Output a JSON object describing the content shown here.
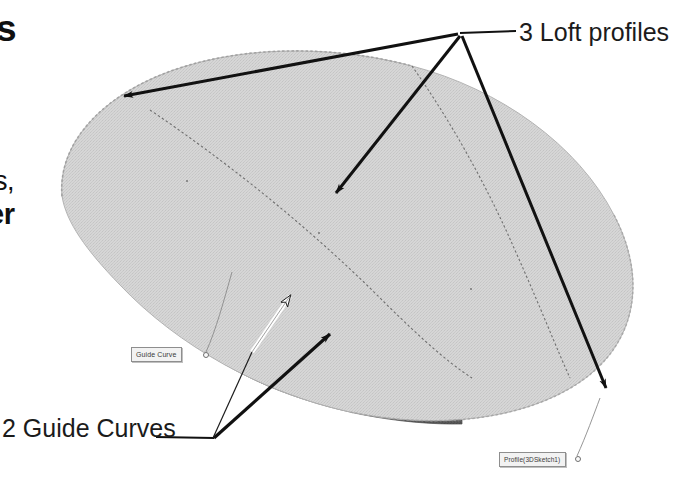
{
  "figure": {
    "type": "cad-loft-diagram",
    "colors": {
      "top_surface": "#d2d2d2",
      "side_face": "#565656",
      "leader_line": "#111111",
      "white_arrow_fill": "#ffffff",
      "page_background": "#ffffff",
      "cad_box_fill": "#f2f2f2",
      "cad_box_border": "#8e8e8e",
      "dotted_curve": "#6e6e6e"
    }
  },
  "annotations": {
    "loft_profiles_label": "3 Loft profiles",
    "guide_curves_label": "2 Guide Curves"
  },
  "cad_callouts": [
    {
      "name": "guide-curve",
      "text": "Guide Curve"
    },
    {
      "name": "profile-3dsketch1",
      "text": "Profile(3DSketch1)"
    }
  ],
  "clipped_text_fragments": [
    {
      "name": "fragment-top",
      "text": "s"
    },
    {
      "name": "fragment-middle",
      "text": "s,"
    },
    {
      "name": "fragment-bottom",
      "text": "er"
    }
  ]
}
